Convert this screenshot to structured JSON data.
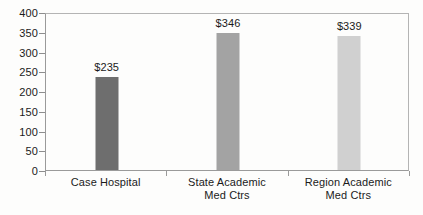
{
  "chart_data": {
    "type": "bar",
    "title": "",
    "subtitle": "",
    "xlabel": "",
    "ylabel": "",
    "categories": [
      "Case Hospital",
      "State Academic Med Ctrs",
      "Region Academic Med Ctrs"
    ],
    "category_lines": [
      [
        "Case Hospital"
      ],
      [
        "State Academic",
        "Med Ctrs"
      ],
      [
        "Region Academic",
        "Med Ctrs"
      ]
    ],
    "values": [
      235,
      346,
      339
    ],
    "data_labels": [
      "$235",
      "$346",
      "$339"
    ],
    "bar_colors": [
      "#6e6e6e",
      "#a3a3a3",
      "#d0d0d0"
    ],
    "ylim": [
      0,
      400
    ],
    "ytick_step": 50,
    "ytick_labels": [
      "0",
      "50",
      "100",
      "150",
      "200",
      "250",
      "300",
      "350",
      "400"
    ],
    "ytick_values": [
      0,
      50,
      100,
      150,
      200,
      250,
      300,
      350,
      400
    ],
    "grid": false,
    "legend": false,
    "legend_position": "none",
    "plot_border_color": "#9a9a9a",
    "background_color": "#fdfdfc",
    "text_color": "#1b1b1b"
  }
}
